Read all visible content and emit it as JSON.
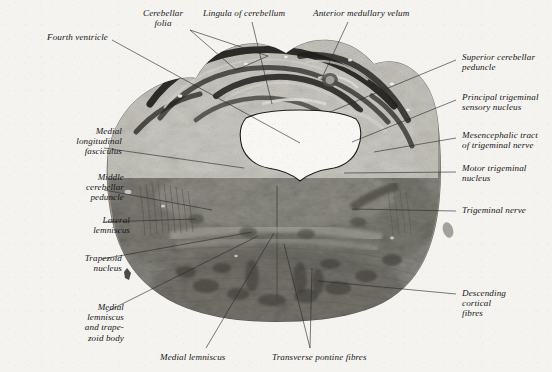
{
  "figure": {
    "kind": "histological-section-photomicrograph",
    "medium": "black-and-white photomicrograph on aged paper",
    "paper_color": "#f4f3ef",
    "ink_color": "#16161a",
    "leader_line_color": "#2a2a2e"
  },
  "labels": [
    {
      "id": "fourth-ventricle",
      "text": "Fourth ventricle",
      "side": "l",
      "x": 8,
      "y": 32,
      "anchor_x": 112,
      "anchor_y": 40,
      "target_x": 300,
      "target_y": 143
    },
    {
      "id": "cerebellar-folia",
      "text": "Cerebellar\nfolia",
      "side": "c",
      "x": 143,
      "y": 8,
      "anchor_x": 205,
      "anchor_y": 28,
      "target_x": 232,
      "target_y": 72
    },
    {
      "id": "cerebellar-folia-2",
      "text": "",
      "side": "c",
      "x": 0,
      "y": 0,
      "anchor_x": 205,
      "anchor_y": 28,
      "target_x": 268,
      "target_y": 56
    },
    {
      "id": "lingula-of-cerebellum",
      "text": "Lingula of cerebellum",
      "side": "c",
      "x": 203,
      "y": 8,
      "anchor_x": 252,
      "anchor_y": 20,
      "target_x": 268,
      "target_y": 103
    },
    {
      "id": "anterior-medullary-velum",
      "text": "Anterior medullary velum",
      "side": "c",
      "x": 313,
      "y": 8,
      "anchor_x": 352,
      "anchor_y": 20,
      "target_x": 322,
      "target_y": 78
    },
    {
      "id": "superior-cerebellar-peduncle",
      "text": "Superior cerebellar\npeduncle",
      "side": "r",
      "x": 462,
      "y": 52,
      "anchor_x": 458,
      "anchor_y": 60,
      "target_x": 332,
      "target_y": 110
    },
    {
      "id": "principal-trigeminal-sensory-nucleus",
      "text": "Principal trigeminal\nsensory nucleus",
      "side": "r",
      "x": 462,
      "y": 92,
      "anchor_x": 458,
      "anchor_y": 100,
      "target_x": 352,
      "target_y": 140
    },
    {
      "id": "mesencephalic-tract-of-trigeminal-nerve",
      "text": "Mesencephalic tract\nof trigeminal nerve",
      "side": "r",
      "x": 462,
      "y": 130,
      "anchor_x": 458,
      "anchor_y": 138,
      "target_x": 372,
      "target_y": 152
    },
    {
      "id": "motor-trigeminal-nucleus",
      "text": "Motor trigeminal\nnucleus",
      "side": "r",
      "x": 462,
      "y": 163,
      "anchor_x": 458,
      "anchor_y": 170,
      "target_x": 345,
      "target_y": 172
    },
    {
      "id": "trigeminal-nerve",
      "text": "Trigeminal nerve",
      "side": "r",
      "x": 462,
      "y": 205,
      "anchor_x": 458,
      "anchor_y": 210,
      "target_x": 352,
      "target_y": 208
    },
    {
      "id": "descending-cortical-fibres",
      "text": "Descending\ncortical\nfibres",
      "side": "r",
      "x": 462,
      "y": 288,
      "anchor_x": 458,
      "anchor_y": 294,
      "target_x": 318,
      "target_y": 281
    },
    {
      "id": "medial-longitudinal-fasciculus",
      "text": "Medial\nlongitudinal\nfasciculus",
      "side": "l",
      "x": 22,
      "y": 126,
      "anchor_x": 105,
      "anchor_y": 148,
      "target_x": 238,
      "target_y": 168
    },
    {
      "id": "middle-cerebellar-peduncle",
      "text": "Middle\ncerebellar\npeduncle",
      "side": "l",
      "x": 24,
      "y": 172,
      "anchor_x": 106,
      "anchor_y": 190,
      "target_x": 208,
      "target_y": 210
    },
    {
      "id": "lateral-lemniscus",
      "text": "Lateral\nlemniscus",
      "side": "l",
      "x": 30,
      "y": 215,
      "anchor_x": 106,
      "anchor_y": 222,
      "target_x": 192,
      "target_y": 218
    },
    {
      "id": "trapezoid-nucleus",
      "text": "Trapezoid\nnucleus",
      "side": "l",
      "x": 22,
      "y": 253,
      "anchor_x": 104,
      "anchor_y": 259,
      "target_x": 248,
      "target_y": 232
    },
    {
      "id": "medial-lemniscus-and-trapezoid-body",
      "text": "Medial\nlemniscus\nand trape-\nzoid body",
      "side": "l",
      "x": 24,
      "y": 302,
      "anchor_x": 108,
      "anchor_y": 312,
      "target_x": 252,
      "target_y": 237
    },
    {
      "id": "medial-lemniscus",
      "text": "Medial lemniscus",
      "side": "c",
      "x": 160,
      "y": 352,
      "anchor_x": 205,
      "anchor_y": 350,
      "target_x": 272,
      "target_y": 234
    },
    {
      "id": "transverse-pontine-fibres",
      "text": "Transverse pontine fibres",
      "side": "c",
      "x": 272,
      "y": 352,
      "anchor_x": 312,
      "anchor_y": 350,
      "target_x": 282,
      "target_y": 243
    }
  ],
  "leaders": [
    {
      "id": "leader-fourth-ventricle",
      "points": "112,40 300,143"
    },
    {
      "id": "leader-cerebellar-folia-a",
      "points": "190,30 236,70"
    },
    {
      "id": "leader-cerebellar-folia-b",
      "points": "190,30 268,56"
    },
    {
      "id": "leader-cerebellar-folia-c",
      "points": "236,70 268,56"
    },
    {
      "id": "leader-lingula",
      "points": "252,22 272,104"
    },
    {
      "id": "leader-anterior-medullary-velum",
      "points": "348,22 322,78"
    },
    {
      "id": "leader-superior-cerebellar-peduncle",
      "points": "456,60 330,112"
    },
    {
      "id": "leader-principal-trigeminal",
      "points": "456,100 352,142"
    },
    {
      "id": "leader-mesencephalic-tract",
      "points": "456,138 374,152"
    },
    {
      "id": "leader-motor-trigeminal-nucleus",
      "points": "456,172 344,173"
    },
    {
      "id": "leader-trigeminal-nerve",
      "points": "456,211 352,209"
    },
    {
      "id": "leader-descending-cortical-fibres",
      "points": "456,294 318,281"
    },
    {
      "id": "leader-mlf",
      "points": "104,148 244,168"
    },
    {
      "id": "leader-middle-cerebellar-peduncle",
      "points": "104,190 212,210"
    },
    {
      "id": "leader-lateral-lemniscus",
      "points": "104,222 196,219"
    },
    {
      "id": "leader-trapezoid-nucleus",
      "points": "102,259 252,232"
    },
    {
      "id": "leader-medial-lemniscus-trapezoid",
      "points": "106,312 258,236"
    },
    {
      "id": "leader-medial-lemniscus",
      "points": "206,348 274,233"
    },
    {
      "id": "leader-transverse-pontine-a",
      "points": "310,348 284,244"
    },
    {
      "id": "leader-transverse-pontine-b",
      "points": "310,348 312,268"
    }
  ]
}
